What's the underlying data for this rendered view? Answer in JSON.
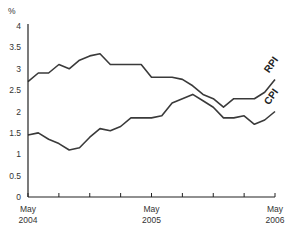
{
  "chart_data": {
    "type": "line",
    "title": "",
    "xlabel": "",
    "ylabel": "%",
    "ylim": [
      0,
      4
    ],
    "yticks": [
      0,
      0.5,
      1,
      1.5,
      2,
      2.5,
      3,
      3.5,
      4
    ],
    "ytick_labels": [
      "0",
      "0.5",
      "1",
      "1.5",
      "2",
      "2.5",
      "3",
      "3.5",
      "4"
    ],
    "x": [
      "May 2004",
      "Jun 2004",
      "Jul 2004",
      "Aug 2004",
      "Sep 2004",
      "Oct 2004",
      "Nov 2004",
      "Dec 2004",
      "Jan 2005",
      "Feb 2005",
      "Mar 2005",
      "Apr 2005",
      "May 2005",
      "Jun 2005",
      "Jul 2005",
      "Aug 2005",
      "Sep 2005",
      "Oct 2005",
      "Nov 2005",
      "Dec 2005",
      "Jan 2006",
      "Feb 2006",
      "Mar 2006",
      "Apr 2006",
      "May 2006"
    ],
    "xtick_labels": [
      {
        "line1": "May",
        "line2": "2004",
        "index": 0
      },
      {
        "line1": "May",
        "line2": "2005",
        "index": 12
      },
      {
        "line1": "May",
        "line2": "2006",
        "index": 24
      }
    ],
    "minor_tick_every": 3,
    "grid": false,
    "legend": "inline labels at line ends",
    "series": [
      {
        "name": "RPI",
        "values": [
          2.7,
          2.9,
          2.9,
          3.1,
          3.0,
          3.2,
          3.3,
          3.35,
          3.1,
          3.1,
          3.1,
          3.1,
          2.8,
          2.8,
          2.8,
          2.75,
          2.6,
          2.4,
          2.3,
          2.1,
          2.3,
          2.3,
          2.3,
          2.45,
          2.75
        ]
      },
      {
        "name": "CPI",
        "values": [
          1.45,
          1.5,
          1.35,
          1.25,
          1.1,
          1.15,
          1.4,
          1.6,
          1.55,
          1.65,
          1.85,
          1.85,
          1.85,
          1.9,
          2.2,
          2.3,
          2.4,
          2.25,
          2.1,
          1.85,
          1.85,
          1.9,
          1.7,
          1.8,
          2.0
        ]
      }
    ]
  },
  "colors": {
    "line": "#3a3a3a",
    "axis": "#222222",
    "text": "#333333"
  }
}
